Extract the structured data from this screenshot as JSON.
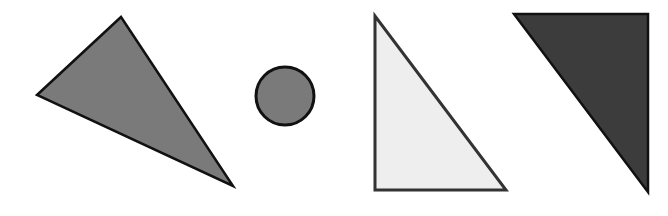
{
  "canvas": {
    "width": 668,
    "height": 216,
    "background": "#ffffff",
    "title": "Geometric Shapes"
  },
  "palette": {
    "stroke": "#111111",
    "medium_gray": "#7a7a7a",
    "light_gray": "#eeeeee",
    "dark_charcoal": "#3c3c3c",
    "white": "#ffffff"
  },
  "chart_data": {
    "type": "scatter",
    "xlabel": "",
    "ylabel": "",
    "xlim": [
      0,
      668
    ],
    "ylim": [
      0,
      216
    ],
    "grid": false,
    "legend": "none",
    "shape_count": 4,
    "shapes": [
      {
        "id": "shape-1",
        "kind": "triangle",
        "name": "obtuse-triangle-gray",
        "fill": "#7a7a7a",
        "stroke": "#111111",
        "stroke_width": 2.5,
        "points": "121,17 37,95 233,186",
        "vertices": [
          [
            121,
            17
          ],
          [
            37,
            95
          ],
          [
            233,
            186
          ]
        ],
        "center": [
          130,
          99
        ]
      },
      {
        "id": "shape-2",
        "kind": "circle",
        "name": "circle-gray",
        "fill": "#7a7a7a",
        "stroke": "#111111",
        "stroke_width": 3,
        "cx": 285,
        "cy": 96,
        "r": 29,
        "diameter": 58
      },
      {
        "id": "shape-3",
        "kind": "triangle",
        "name": "right-triangle-light",
        "fill": "#eeeeee",
        "stroke": "#333333",
        "stroke_width": 3,
        "points": "375,16 375,190 506,190",
        "vertices": [
          [
            375,
            16
          ],
          [
            375,
            190
          ],
          [
            506,
            190
          ]
        ],
        "right_angle_at": "bottom-left",
        "center": [
          419,
          132
        ]
      },
      {
        "id": "shape-4",
        "kind": "triangle",
        "name": "right-triangle-dark",
        "fill": "#3c3c3c",
        "stroke": "#111111",
        "stroke_width": 2.5,
        "points": "514,14 648,14 648,192",
        "vertices": [
          [
            514,
            14
          ],
          [
            648,
            14
          ],
          [
            648,
            192
          ]
        ],
        "right_angle_at": "top-right",
        "center": [
          603,
          73
        ]
      }
    ]
  }
}
